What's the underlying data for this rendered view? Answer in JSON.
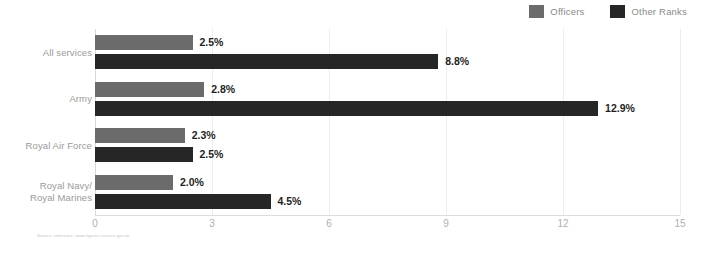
{
  "chart_data": {
    "type": "bar",
    "orientation": "horizontal",
    "title": "",
    "subtitle": "",
    "xlabel": "",
    "ylabel": "",
    "xlim": [
      0,
      15
    ],
    "xticks": [
      "0",
      "3",
      "6",
      "9",
      "12",
      "15"
    ],
    "grid": true,
    "legend_position": "top-right",
    "categories": [
      "All services",
      "Army",
      "Royal Air Force",
      "Royal Navy/ Royal Marines"
    ],
    "category_lines": [
      [
        "All services"
      ],
      [
        "Army"
      ],
      [
        "Royal Air Force"
      ],
      [
        "Royal Navy/",
        "Royal Marines"
      ]
    ],
    "series": [
      {
        "name": "Officers",
        "color": "#6b6b6b",
        "values": [
          2.5,
          2.8,
          2.3,
          2.0
        ],
        "labels": [
          "2.5%",
          "2.8%",
          "2.3%",
          "2.0%"
        ]
      },
      {
        "name": "Other Ranks",
        "color": "#262626",
        "values": [
          8.8,
          12.9,
          2.5,
          4.5
        ],
        "labels": [
          "8.8%",
          "12.9%",
          "2.5%",
          "4.5%"
        ]
      }
    ]
  },
  "legend": {
    "items": [
      {
        "label": "Officers",
        "color": "#6b6b6b"
      },
      {
        "label": "Other Ranks",
        "color": "#262626"
      }
    ]
  },
  "footer": {
    "source_note": "Source: reference, www.figures.service.gov.uk"
  },
  "colors": {
    "officers": "#6b6b6b",
    "other_ranks": "#262626",
    "gridline": "#ededed",
    "axis": "#d8d8d8",
    "tick_text": "#b0b0b0",
    "category_text": "#9a9a9a",
    "value_text": "#1f1f1f",
    "legend_text": "#8a8a8a",
    "background": "#ffffff"
  }
}
